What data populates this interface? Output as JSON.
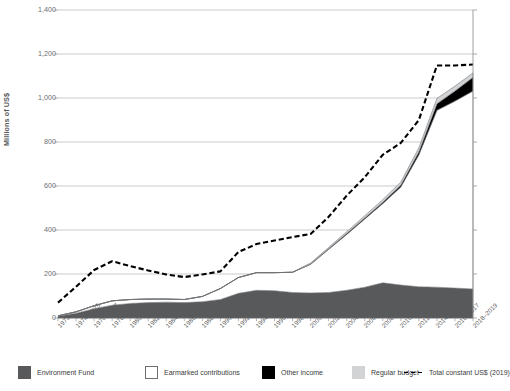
{
  "chart_data": {
    "type": "area",
    "title": "",
    "subtitle": "",
    "xlabel": "",
    "ylabel": "Millions of US$",
    "ylim": [
      0,
      1400
    ],
    "ytick_values": [
      0,
      200,
      400,
      600,
      800,
      1000,
      1200,
      1400
    ],
    "ytick_labels": [
      "0",
      "200",
      "400",
      "600",
      "800",
      "1,000",
      "1,200",
      "1,400"
    ],
    "grid": true,
    "grid_axis": "y",
    "legend_position": "bottom",
    "stacked": true,
    "categories": [
      "1973",
      "1974–1975",
      "1976–1977",
      "1978–1979",
      "1980–1981",
      "1982–1983",
      "1984–1985",
      "1986–1987",
      "1988–1989",
      "1990–1991",
      "1992–1993",
      "1994–1995",
      "1996–1997",
      "1998–1999",
      "2000–2001",
      "2002–2003",
      "2004–2005",
      "2006–2007",
      "2008–2009",
      "2010–2011",
      "2012–2013",
      "2014–2015",
      "2016–2017",
      "2018–2019"
    ],
    "series": [
      {
        "name": "Environment Fund",
        "color": "#58595b",
        "kind": "area",
        "values": [
          8,
          22,
          42,
          58,
          66,
          70,
          72,
          70,
          74,
          84,
          112,
          126,
          124,
          116,
          114,
          116,
          126,
          140,
          160,
          150,
          142,
          140,
          136,
          132
        ]
      },
      {
        "name": "Earmarked contributions",
        "color": "#ffffff",
        "kind": "area",
        "values": [
          2,
          6,
          14,
          20,
          18,
          16,
          14,
          14,
          24,
          50,
          72,
          80,
          82,
          92,
          130,
          196,
          254,
          310,
          360,
          446,
          600,
          804,
          850,
          900
        ]
      },
      {
        "name": "Other income",
        "color": "#000000",
        "kind": "area",
        "values": [
          0,
          0,
          0,
          0,
          0,
          0,
          0,
          0,
          0,
          0,
          0,
          0,
          0,
          0,
          2,
          3,
          4,
          5,
          6,
          8,
          14,
          30,
          46,
          62
        ]
      },
      {
        "name": "Regular budget",
        "color": "#d1d3d4",
        "kind": "area",
        "values": [
          0,
          0,
          0,
          0,
          0,
          0,
          0,
          0,
          0,
          0,
          0,
          0,
          0,
          0,
          4,
          6,
          8,
          10,
          12,
          14,
          18,
          24,
          22,
          20
        ]
      },
      {
        "name": "Total constant US$ (2019)",
        "color": "#000000",
        "kind": "dashed-line",
        "values": [
          70,
          142,
          218,
          258,
          236,
          216,
          198,
          186,
          198,
          212,
          300,
          336,
          352,
          368,
          382,
          460,
          556,
          640,
          742,
          796,
          900,
          1148,
          1148,
          1152
        ]
      }
    ]
  },
  "legend": {
    "items": [
      {
        "label": "Environment Fund",
        "swatch": "filled",
        "color": "#58595b"
      },
      {
        "label": "Earmarked contributions",
        "swatch": "outline",
        "color": "#ffffff"
      },
      {
        "label": "Other income",
        "swatch": "filled",
        "color": "#000000"
      },
      {
        "label": "Regular budget",
        "swatch": "filled",
        "color": "#d1d3d4"
      },
      {
        "label": "Total constant US$ (2019)",
        "swatch": "dashed-line",
        "color": "#000000"
      }
    ]
  }
}
